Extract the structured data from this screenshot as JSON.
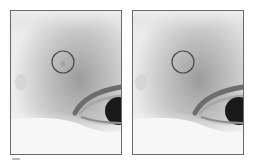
{
  "figure": {
    "panels": [
      {
        "id": "before",
        "label": "",
        "highlight_circle": {
          "cx": 52,
          "cy": 51,
          "r": 11
        },
        "has_blemish": true
      },
      {
        "id": "after",
        "label": "",
        "highlight_circle": {
          "cx": 50,
          "cy": 51,
          "r": 11
        },
        "has_blemish": false
      }
    ],
    "colors": {
      "frame": "#6a6a6a",
      "circle": "#4a4a4a",
      "skin_light": "#f2f2f2",
      "skin_mid": "#bdbdbd",
      "skin_dark": "#8a8a8a",
      "iris": "#1a1a1a"
    }
  }
}
